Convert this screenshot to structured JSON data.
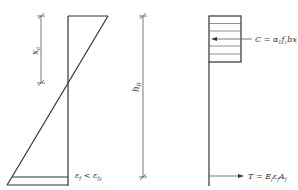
{
  "strain_diagram": {
    "xc_label": "x",
    "xc_sub": "c",
    "h0_label": "h",
    "h0_sub": "0",
    "strain_label": {
      "eps": "ε",
      "f_sub": "f",
      "lt": " < ",
      "eps2": "ε",
      "fy_sub": "fy"
    }
  },
  "stress_diagram": {
    "compression": {
      "lhs": "C",
      "eq": " = ",
      "alpha": "α",
      "alpha_sub": "1",
      "f": "f",
      "f_sub": "c",
      "rest": "bx"
    },
    "tension": {
      "lhs": "T",
      "eq": " = ",
      "E": "E",
      "E_sub": "f",
      "eps": "ε",
      "eps_sub": "f",
      "A": "A",
      "A_sub": "f"
    }
  },
  "colors": {
    "line": "#333333",
    "thin": "#555555",
    "hatch": "#666666"
  }
}
